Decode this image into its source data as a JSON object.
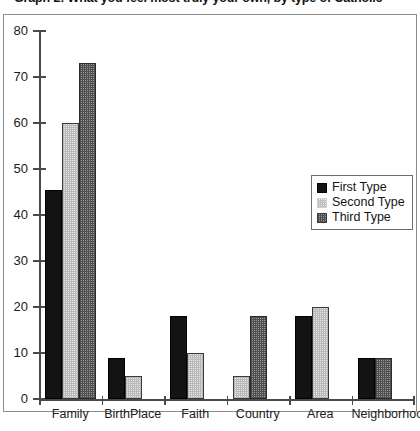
{
  "chart_data": {
    "type": "bar",
    "title": "Graph 2: What you feel most truly your own, by type of Catholic",
    "xlabel": "",
    "ylabel": "",
    "ylim": [
      0,
      80
    ],
    "yticks": [
      0,
      10,
      20,
      30,
      40,
      50,
      60,
      70,
      80
    ],
    "grid": false,
    "legend_position": "center-right",
    "categories": [
      "Family",
      "BirthPlace",
      "Faith",
      "Country",
      "Area",
      "Neighborhood"
    ],
    "series": [
      {
        "name": "First Type",
        "values": [
          45.5,
          9,
          18,
          0,
          18,
          9
        ]
      },
      {
        "name": "Second Type",
        "values": [
          60,
          5,
          10,
          5,
          20,
          0
        ]
      },
      {
        "name": "Third Type",
        "values": [
          73,
          0,
          0,
          18,
          0,
          9
        ]
      }
    ]
  },
  "legend": {
    "items": [
      {
        "label": "First Type"
      },
      {
        "label": "Second Type"
      },
      {
        "label": "Third Type"
      }
    ]
  }
}
